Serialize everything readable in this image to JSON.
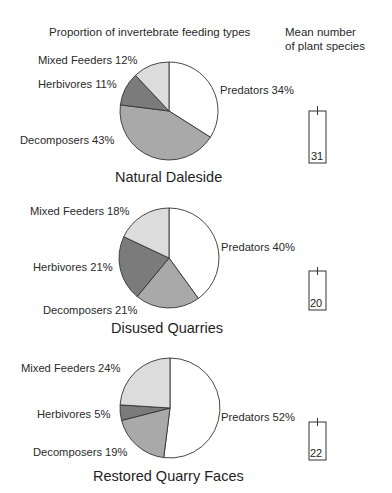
{
  "header": {
    "pie_title": "Proportion of invertebrate feeding types",
    "bar_title_line1": "Mean number",
    "bar_title_line2": "of plant species"
  },
  "colors": {
    "predators": "#ffffff",
    "decomposers": "#a9a9a9",
    "herbivores": "#7b7b7b",
    "mixed_feeders": "#dcdcdc",
    "outline": "#333333"
  },
  "panels": [
    {
      "site": "Natural Daleside",
      "labels": {
        "predators": "Predators 34%",
        "decomposers": "Decomposers 43%",
        "herbivores": "Herbivores 11%",
        "mixed_feeders": "Mixed Feeders 12%"
      },
      "mean_plant_species": "31"
    },
    {
      "site": "Disused Quarries",
      "labels": {
        "predators": "Predators 40%",
        "decomposers": "Decomposers 21%",
        "herbivores": "Herbivores 21%",
        "mixed_feeders": "Mixed Feeders 18%"
      },
      "mean_plant_species": "20"
    },
    {
      "site": "Restored Quarry Faces",
      "labels": {
        "predators": "Predators 52%",
        "decomposers": "Decomposers 19%",
        "herbivores": "Herbivores 5%",
        "mixed_feeders": "Mixed Feeders 24%"
      },
      "mean_plant_species": "22"
    }
  ],
  "chart_data": [
    {
      "type": "pie",
      "title": "Natural Daleside",
      "categories": [
        "Predators",
        "Decomposers",
        "Herbivores",
        "Mixed Feeders"
      ],
      "values": [
        34,
        43,
        11,
        12
      ],
      "unit": "%"
    },
    {
      "type": "pie",
      "title": "Disused Quarries",
      "categories": [
        "Predators",
        "Decomposers",
        "Herbivores",
        "Mixed Feeders"
      ],
      "values": [
        40,
        21,
        21,
        18
      ],
      "unit": "%"
    },
    {
      "type": "pie",
      "title": "Restored Quarry Faces",
      "categories": [
        "Predators",
        "Decomposers",
        "Herbivores",
        "Mixed Feeders"
      ],
      "values": [
        52,
        19,
        5,
        24
      ],
      "unit": "%"
    },
    {
      "type": "bar",
      "title": "Mean number of plant species",
      "categories": [
        "Natural Daleside",
        "Disused Quarries",
        "Restored Quarry Faces"
      ],
      "values": [
        31,
        20,
        22
      ],
      "error_bars": true
    }
  ]
}
